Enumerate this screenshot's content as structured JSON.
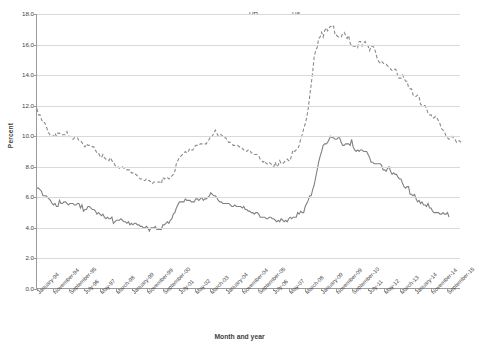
{
  "chart_data": {
    "type": "line",
    "title": "",
    "xlabel": "Month and year",
    "ylabel": "Percent",
    "ylim": [
      0.0,
      18.0
    ],
    "yticks": [
      "0.0",
      "2.0",
      "4.0",
      "6.0",
      "8.0",
      "10.0",
      "12.0",
      "14.0",
      "16.0",
      "18.0"
    ],
    "grid": true,
    "legend_position": "top-center",
    "x_tick_labels": [
      "January-94",
      "November-94",
      "September-95",
      "July-96",
      "May-97",
      "March-98",
      "January-99",
      "November-99",
      "September-00",
      "July-01",
      "May-02",
      "March-03",
      "January-04",
      "November-04",
      "September-05",
      "July-06",
      "May-07",
      "March-08",
      "January-09",
      "November-09",
      "September-10",
      "July-11",
      "May-12",
      "March-13",
      "January-14",
      "November-14",
      "September-15"
    ],
    "x_start": "January-94",
    "x_end": "2016",
    "colors": {
      "UR": "#808080",
      "U6": "#8a8a8a",
      "gridline": "#d9d9d9",
      "axis": "#9a9a9a"
    },
    "series": [
      {
        "name": "UR",
        "style": "solid",
        "values": [
          6.6,
          6.6,
          6.5,
          6.4,
          6.1,
          6.1,
          6.1,
          6.0,
          5.9,
          5.8,
          5.6,
          5.5,
          5.6,
          5.4,
          5.4,
          5.8,
          5.6,
          5.6,
          5.7,
          5.7,
          5.6,
          5.5,
          5.6,
          5.6,
          5.6,
          5.5,
          5.5,
          5.6,
          5.6,
          5.3,
          5.5,
          5.1,
          5.2,
          5.2,
          5.4,
          5.4,
          5.3,
          5.2,
          5.2,
          5.1,
          4.9,
          5.0,
          4.9,
          4.8,
          4.9,
          4.7,
          4.6,
          4.7,
          4.6,
          4.6,
          4.7,
          4.3,
          4.4,
          4.5,
          4.5,
          4.5,
          4.6,
          4.5,
          4.4,
          4.4,
          4.3,
          4.4,
          4.2,
          4.3,
          4.2,
          4.3,
          4.3,
          4.2,
          4.2,
          4.1,
          4.1,
          4.0,
          4.0,
          4.1,
          4.0,
          3.8,
          4.0,
          4.0,
          4.0,
          4.1,
          3.9,
          3.9,
          3.9,
          3.9,
          4.2,
          4.2,
          4.3,
          4.4,
          4.3,
          4.5,
          4.6,
          4.9,
          5.0,
          5.3,
          5.5,
          5.7,
          5.7,
          5.7,
          5.7,
          5.9,
          5.8,
          5.8,
          5.8,
          5.7,
          5.7,
          5.7,
          5.9,
          5.9,
          5.8,
          5.9,
          6.0,
          5.8,
          5.9,
          5.9,
          6.0,
          6.1,
          6.3,
          6.2,
          6.1,
          6.1,
          6.0,
          5.8,
          5.7,
          5.7,
          5.6,
          5.6,
          5.6,
          5.6,
          5.6,
          5.5,
          5.4,
          5.4,
          5.5,
          5.4,
          5.4,
          5.4,
          5.4,
          5.3,
          5.4,
          5.2,
          5.2,
          5.1,
          5.1,
          5.0,
          5.0,
          4.9,
          5.0,
          5.0,
          4.9,
          4.7,
          4.7,
          4.7,
          4.7,
          4.6,
          4.6,
          4.7,
          4.7,
          4.6,
          4.6,
          4.5,
          4.4,
          4.5,
          4.4,
          4.6,
          4.5,
          4.4,
          4.5,
          4.4,
          4.6,
          4.7,
          4.6,
          4.7,
          4.7,
          4.7,
          5.0,
          4.9,
          5.1,
          5.0,
          5.0,
          5.4,
          5.6,
          5.8,
          6.1,
          6.1,
          6.5,
          6.8,
          7.3,
          7.8,
          8.3,
          8.7,
          9.0,
          9.4,
          9.5,
          9.5,
          9.6,
          9.8,
          10.0,
          9.9,
          9.9,
          9.8,
          9.8,
          9.9,
          9.9,
          9.6,
          9.4,
          9.4,
          9.5,
          9.5,
          9.5,
          9.4,
          9.8,
          9.3,
          9.1,
          9.0,
          9.1,
          9.0,
          9.1,
          9.1,
          9.0,
          9.0,
          9.0,
          8.8,
          8.6,
          8.3,
          8.3,
          8.2,
          8.2,
          8.2,
          8.2,
          8.2,
          8.1,
          7.8,
          7.8,
          7.7,
          7.9,
          8.0,
          7.7,
          7.5,
          7.6,
          7.5,
          7.5,
          7.3,
          7.2,
          7.2,
          6.9,
          6.7,
          6.6,
          6.7,
          6.7,
          6.2,
          6.2,
          6.1,
          6.2,
          5.9,
          5.7,
          5.8,
          5.6,
          5.7,
          5.5,
          5.5,
          5.4,
          5.6,
          5.3,
          5.3,
          5.1,
          5.0,
          5.0,
          5.0,
          5.0,
          4.9,
          4.9,
          5.0,
          4.9,
          4.9,
          5.0,
          4.7
        ]
      },
      {
        "name": "U6",
        "style": "dashed",
        "values": [
          11.8,
          11.4,
          11.4,
          11.1,
          10.9,
          10.9,
          10.7,
          10.4,
          10.2,
          10.0,
          10.0,
          10.0,
          10.2,
          10.0,
          10.2,
          10.2,
          10.1,
          10.1,
          10.1,
          10.1,
          10.3,
          10.0,
          10.0,
          9.9,
          9.8,
          9.9,
          9.9,
          9.9,
          9.7,
          9.7,
          9.6,
          9.4,
          9.3,
          9.5,
          9.4,
          9.4,
          9.4,
          9.3,
          9.3,
          9.1,
          8.9,
          8.9,
          8.7,
          8.6,
          8.8,
          8.6,
          8.5,
          8.5,
          8.4,
          8.6,
          8.4,
          8.3,
          8.1,
          8.0,
          8.0,
          7.9,
          8.0,
          8.0,
          7.9,
          7.9,
          7.8,
          7.8,
          7.8,
          7.6,
          7.6,
          7.5,
          7.5,
          7.4,
          7.3,
          7.2,
          7.2,
          7.1,
          7.1,
          7.2,
          7.1,
          7.1,
          7.0,
          6.9,
          7.0,
          7.0,
          7.0,
          7.0,
          7.0,
          6.9,
          7.3,
          7.2,
          7.3,
          7.3,
          7.2,
          7.3,
          7.4,
          7.5,
          7.7,
          8.2,
          8.4,
          8.6,
          8.7,
          8.8,
          8.9,
          9.0,
          8.9,
          9.0,
          9.2,
          9.1,
          9.1,
          9.3,
          9.4,
          9.4,
          9.4,
          9.5,
          9.5,
          9.5,
          9.5,
          9.5,
          9.7,
          9.8,
          10.0,
          10.0,
          10.2,
          10.4,
          10.2,
          10.0,
          10.1,
          10.1,
          10.0,
          9.9,
          9.9,
          9.7,
          9.6,
          9.6,
          9.5,
          9.4,
          9.4,
          9.4,
          9.4,
          9.3,
          9.3,
          9.2,
          9.1,
          9.1,
          9.0,
          9.1,
          9.1,
          8.9,
          8.9,
          8.8,
          8.8,
          8.8,
          8.7,
          8.5,
          8.4,
          8.3,
          8.4,
          8.2,
          8.2,
          8.3,
          8.2,
          8.1,
          8.0,
          8.3,
          8.0,
          8.1,
          8.4,
          8.2,
          8.2,
          8.3,
          8.4,
          8.5,
          8.4,
          8.4,
          8.8,
          9.1,
          9.0,
          9.1,
          9.2,
          9.4,
          9.8,
          10.1,
          10.5,
          10.8,
          11.2,
          11.8,
          12.6,
          13.4,
          14.2,
          15.2,
          15.6,
          15.8,
          16.4,
          16.5,
          16.8,
          16.5,
          16.9,
          17.1,
          16.9,
          17.1,
          17.2,
          17.1,
          17.2,
          16.6,
          16.6,
          16.5,
          16.5,
          16.5,
          16.7,
          16.8,
          16.6,
          16.4,
          16.6,
          16.1,
          15.9,
          15.9,
          15.9,
          15.9,
          15.8,
          16.2,
          16.2,
          15.9,
          16.1,
          16.2,
          16.0,
          15.9,
          15.6,
          15.9,
          15.9,
          15.8,
          15.5,
          15.1,
          14.9,
          14.8,
          14.9,
          14.8,
          14.7,
          14.7,
          14.6,
          14.5,
          14.4,
          14.3,
          14.3,
          14.4,
          14.3,
          13.8,
          13.8,
          13.8,
          14.0,
          13.8,
          13.6,
          13.6,
          13.2,
          13.1,
          13.1,
          12.7,
          12.6,
          12.6,
          12.7,
          12.6,
          12.1,
          12.0,
          12.0,
          12.0,
          11.8,
          11.5,
          11.4,
          11.4,
          11.2,
          11.2,
          11.3,
          11.2,
          11.0,
          10.8,
          10.5,
          10.4,
          10.3,
          10.0,
          9.9,
          9.8,
          9.9,
          10.0,
          9.9,
          9.8,
          9.6,
          9.7,
          9.7,
          9.6
        ]
      }
    ]
  },
  "legend": {
    "items": [
      {
        "label": "UR",
        "style": "solid"
      },
      {
        "label": "U6",
        "style": "dashed"
      }
    ]
  },
  "axis": {
    "y_title": "Percent",
    "x_title": "Month and year"
  }
}
